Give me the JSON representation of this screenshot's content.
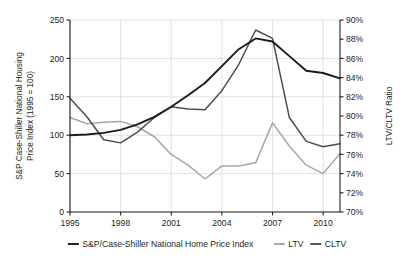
{
  "chart_data": {
    "type": "line",
    "title": "",
    "xlabel": "",
    "ylabel": "S&P Case-Shiller National Housing Price Index (1995 = 100)",
    "y2label": "LTV/CLTV Ratio",
    "grid": true,
    "legend_position": "bottom",
    "x": [
      1995,
      1996,
      1997,
      1998,
      1999,
      2000,
      2001,
      2002,
      2003,
      2004,
      2005,
      2006,
      2007,
      2008,
      2009,
      2010,
      2011
    ],
    "xlim": [
      1995,
      2011
    ],
    "xticks": [
      1995,
      1998,
      2001,
      2004,
      2007,
      2010
    ],
    "xtick_labels": [
      "1995",
      "1998",
      "2001",
      "2004",
      "2007",
      "2010"
    ],
    "ylim": [
      0,
      250
    ],
    "yticks": [
      0,
      50,
      100,
      150,
      200,
      250
    ],
    "ytick_labels": [
      "0",
      "50",
      "100",
      "150",
      "200",
      "250"
    ],
    "y2lim": [
      70,
      90
    ],
    "y2ticks": [
      70,
      72,
      74,
      76,
      78,
      80,
      82,
      84,
      86,
      88,
      90
    ],
    "y2tick_labels": [
      "70%",
      "72%",
      "74%",
      "76%",
      "78%",
      "80%",
      "82%",
      "84%",
      "86%",
      "88%",
      "90%"
    ],
    "series": [
      {
        "name": "S&P/Case-Shiller National Home Price Index",
        "axis": "left",
        "color": "#1a1a1a",
        "width": 1.9,
        "values": [
          100,
          101,
          103,
          107,
          114,
          124,
          137,
          152,
          168,
          190,
          212,
          226,
          222,
          203,
          184,
          181,
          174
        ]
      },
      {
        "name": "LTV",
        "axis": "right",
        "color": "#a6a6a6",
        "width": 1.5,
        "values_right_pct": [
          79.8,
          79.2,
          79.4,
          79.4,
          78.9,
          77.9,
          76.0,
          74.9,
          73.9,
          74.8,
          74.8,
          75.1,
          79.3,
          76.9,
          74.9,
          74.0,
          76.1
        ],
        "values_left_equiv": [
          123,
          115,
          117,
          118,
          111,
          98,
          75,
          61,
          43,
          60,
          60,
          64,
          116,
          86,
          61,
          50,
          76
        ]
      },
      {
        "name": "CLTV",
        "axis": "right",
        "color": "#4d4d4d",
        "width": 1.5,
        "values_right_pct": [
          81.9,
          79.9,
          77.5,
          77.2,
          78.3,
          79.8,
          81.4,
          81.3,
          81.2,
          83.0,
          85.7,
          88.9,
          88.1,
          79.8,
          77.4,
          76.8,
          77.1
        ],
        "values_left_equiv": [
          148,
          124,
          94,
          90,
          104,
          123,
          137,
          134,
          133,
          158,
          192,
          237,
          226,
          123,
          92,
          85,
          89
        ]
      }
    ]
  },
  "legend": {
    "items": [
      {
        "label": "S&P/Case-Shiller National Home Price Index",
        "color": "#1a1a1a"
      },
      {
        "label": "LTV",
        "color": "#a6a6a6"
      },
      {
        "label": "CLTV",
        "color": "#4d4d4d"
      }
    ]
  },
  "axes": {
    "left_title_line1": "S&P Case-Shiller National Housing",
    "left_title_line2": "Price Index (1995 = 100)",
    "right_title": "LTV/CLTV Ratio"
  },
  "colors": {
    "axis": "#231f20",
    "grid": "#d9d9d9",
    "background": "#ffffff"
  }
}
